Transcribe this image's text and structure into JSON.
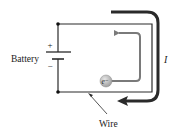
{
  "diagram": {
    "battery_label": "Battery",
    "plus_sign": "+",
    "minus_sign": "−",
    "electron_label": "e⁻",
    "current_label": "I",
    "wire_label": "Wire",
    "colors": {
      "wire": "#2b2b2b",
      "current_arrow": "#2a2a2a",
      "electron_path": "#7a7a7a",
      "electron_fill": "#b8b8b8",
      "text": "#222222"
    }
  }
}
